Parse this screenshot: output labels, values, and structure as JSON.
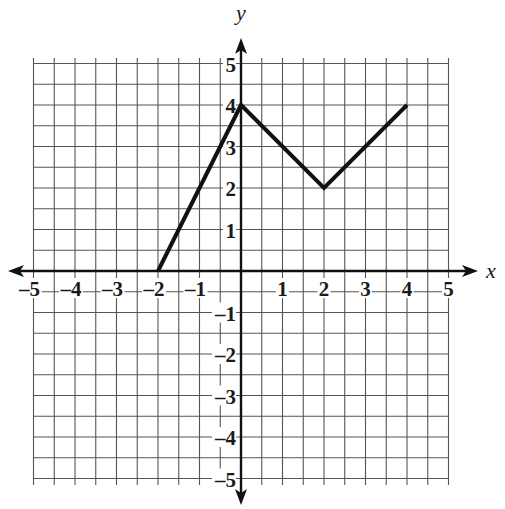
{
  "chart_data": {
    "type": "line",
    "title": "",
    "xlabel": "x",
    "ylabel": "y",
    "xlim": [
      -5,
      5
    ],
    "ylim": [
      -5,
      5
    ],
    "grid": true,
    "grid_step": 0.5,
    "x_ticks": [
      -5,
      -4,
      -3,
      -2,
      -1,
      1,
      2,
      3,
      4,
      5
    ],
    "y_ticks": [
      -5,
      -4,
      -3,
      -2,
      -1,
      1,
      2,
      3,
      4,
      5
    ],
    "x_tick_labels": [
      "–5",
      "–4",
      "–3",
      "–2",
      "–1",
      "1",
      "2",
      "3",
      "4",
      "5"
    ],
    "y_tick_labels": [
      "–5",
      "–4",
      "–3",
      "–2",
      "–1",
      "1",
      "2",
      "3",
      "4",
      "5"
    ],
    "series": [
      {
        "name": "piecewise linear graph",
        "x": [
          -2,
          0,
          2,
          4
        ],
        "y": [
          0,
          4,
          2,
          4
        ]
      }
    ],
    "legend": null
  },
  "layout": {
    "origin_px": [
      241,
      271
    ],
    "unit_px": 41.5,
    "grid_left_px": 34,
    "grid_right_px": 449,
    "grid_top_px": 58,
    "grid_bottom_px": 485,
    "x_axis_extent_px": [
      8,
      478
    ],
    "y_axis_extent_px": [
      38,
      505
    ],
    "colors": {
      "grid": "#555555",
      "axis": "#111111",
      "line": "#111111",
      "background": "#ffffff"
    }
  }
}
